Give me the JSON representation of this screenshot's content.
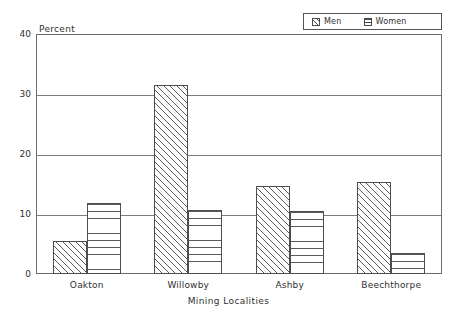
{
  "chart_data": {
    "type": "bar",
    "title": "",
    "xlabel": "Mining Localities",
    "ylabel": "Percent",
    "categories": [
      "Oakton",
      "Willowby",
      "Ashby",
      "Beechthorpe"
    ],
    "series": [
      {
        "name": "Men",
        "values": [
          5.5,
          31.5,
          14.7,
          15.4
        ],
        "pattern": "diagonal-hatch"
      },
      {
        "name": "Women",
        "values": [
          11.8,
          10.7,
          10.5,
          3.5
        ],
        "pattern": "horizontal-lines"
      }
    ],
    "ylim": [
      0,
      40
    ],
    "yticks": [
      0,
      10,
      20,
      30,
      40
    ],
    "ytick_labels": [
      "0",
      "10",
      "20",
      "30",
      "40"
    ],
    "grid": true,
    "grid_axis": "y",
    "legend_position": "top-right",
    "legend_entries": [
      "Men",
      "Women"
    ]
  },
  "axes": {
    "y_axis_caption": "Percent",
    "x_axis_caption": "Mining Localities",
    "ytick_labels": [
      "40",
      "30",
      "20",
      "10",
      "0"
    ],
    "xtick_labels": [
      "Oakton",
      "Willowby",
      "Ashby",
      "Beechthorpe"
    ]
  },
  "legend": {
    "men": {
      "label": "Men",
      "swatch": "diagonal-hatch-swatch"
    },
    "women": {
      "label": "Women",
      "swatch": "horizontal-lines-swatch"
    }
  },
  "colors": {
    "background": "#ffffff",
    "axis": "#6e6e6e",
    "gridline": "#7d7d7d",
    "bar_outline": "#4d4d4d",
    "hatch": "#5a5a5a",
    "text": "#2f2f2f"
  }
}
